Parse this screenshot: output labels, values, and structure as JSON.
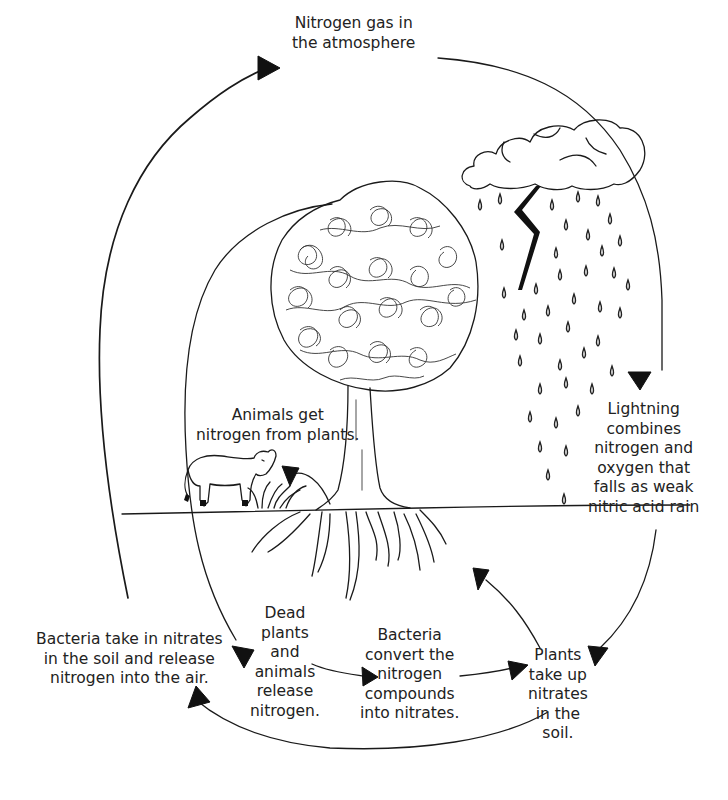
{
  "diagram": {
    "style": "pencil line drawing, black on white",
    "colors": {
      "background": "#ffffff",
      "ink": "#1a1a1a"
    }
  },
  "labels": {
    "atmosphere": {
      "lines": [
        "Nitrogen gas in",
        "the atmosphere"
      ]
    },
    "lightning": {
      "lines": [
        "Lightning",
        "combines",
        "nitrogen and",
        "oxygen that",
        "falls as weak",
        "nitric acid rain"
      ]
    },
    "animals": {
      "lines": [
        "Animals get",
        "nitrogen from plants."
      ]
    },
    "bacteria_release": {
      "lines": [
        "Bacteria take in nitrates",
        "in the soil and release",
        "nitrogen into the air."
      ]
    },
    "dead_matter": {
      "lines": [
        "Dead",
        "plants",
        "and",
        "animals",
        "release",
        "nitrogen."
      ]
    },
    "bacteria_convert": {
      "lines": [
        "Bacteria",
        "convert the",
        "nitrogen",
        "compounds",
        "into nitrates."
      ]
    },
    "plants_uptake": {
      "lines": [
        "Plants",
        "take up",
        "nitrates",
        "in the",
        "soil."
      ]
    }
  },
  "illustrations": [
    {
      "name": "storm-cloud",
      "description": "cloud with rain drops"
    },
    {
      "name": "lightning-bolt",
      "description": "zigzag bolt below cloud"
    },
    {
      "name": "tree",
      "description": "scribbled round canopy with trunk"
    },
    {
      "name": "roots",
      "description": "branching roots below ground line"
    },
    {
      "name": "cow",
      "description": "grazing animal on left of tree"
    },
    {
      "name": "grass-tuft",
      "description": "small plant near tree base"
    },
    {
      "name": "ground-line",
      "description": "horizontal soil surface"
    }
  ],
  "flow": [
    {
      "from": "atmosphere",
      "to": "lightning"
    },
    {
      "from": "lightning",
      "to": "plants_uptake"
    },
    {
      "from": "plants_uptake",
      "to": "tree"
    },
    {
      "from": "plants_uptake",
      "to": "bacteria_release"
    },
    {
      "from": "bacteria_release",
      "to": "atmosphere"
    },
    {
      "from": "tree",
      "to": "dead_matter"
    },
    {
      "from": "dead_matter",
      "to": "bacteria_convert"
    },
    {
      "from": "bacteria_convert",
      "to": "plants_uptake"
    },
    {
      "from": "grass",
      "to": "animals"
    }
  ]
}
